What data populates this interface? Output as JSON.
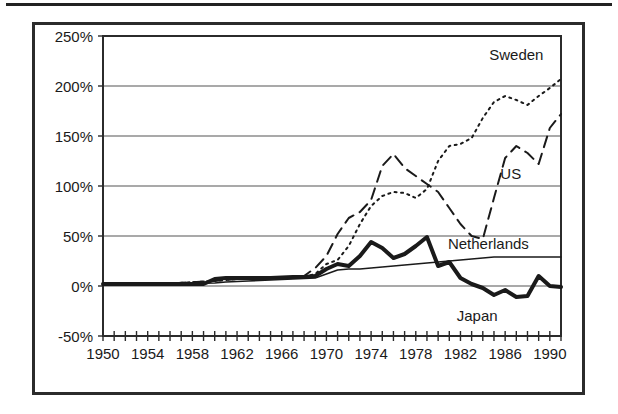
{
  "figure": {
    "frame_color": "#2b2b2b",
    "background": "#ffffff",
    "has_top_rule": true
  },
  "chart_data": {
    "type": "line",
    "title": "",
    "subtitle": "",
    "xlabel": "",
    "ylabel": "",
    "xlim": [
      1950,
      1991
    ],
    "ylim": [
      -50,
      250
    ],
    "ytick_values": [
      250,
      200,
      150,
      100,
      50,
      0,
      -50
    ],
    "ytick_labels": [
      "250%",
      "200%",
      "150%",
      "100%",
      "50%",
      "0%",
      "-50%"
    ],
    "xtick_labels": [
      "1950",
      "1954",
      "1958",
      "1962",
      "1966",
      "1970",
      "1974",
      "1978",
      "1982",
      "1986",
      "1990"
    ],
    "xtick_values": [
      1950,
      1954,
      1958,
      1962,
      1966,
      1970,
      1974,
      1978,
      1982,
      1986,
      1990
    ],
    "xtick_minor_step": 1,
    "grid": "horizontal",
    "legend_position": "inline-annotations",
    "series": [
      {
        "name": "Sweden",
        "style": "dotted",
        "color": "#1a1a1a",
        "width": 2,
        "label_x": 1987.0,
        "label_y": 232,
        "x": [
          1950,
          1955,
          1960,
          1962,
          1964,
          1966,
          1968,
          1969,
          1970,
          1971,
          1972,
          1973,
          1974,
          1975,
          1976,
          1977,
          1978,
          1979,
          1980,
          1981,
          1982,
          1983,
          1984,
          1985,
          1986,
          1987,
          1988,
          1989,
          1990,
          1991
        ],
        "y": [
          2,
          2,
          5,
          7,
          8,
          8,
          9,
          12,
          22,
          26,
          40,
          62,
          80,
          90,
          94,
          93,
          88,
          97,
          125,
          140,
          142,
          148,
          168,
          184,
          190,
          186,
          181,
          190,
          198,
          207
        ]
      },
      {
        "name": "US",
        "style": "dashed",
        "color": "#1a1a1a",
        "width": 2,
        "label_x": 1986.5,
        "label_y": 113,
        "x": [
          1950,
          1955,
          1960,
          1962,
          1964,
          1966,
          1968,
          1969,
          1970,
          1971,
          1972,
          1973,
          1974,
          1975,
          1976,
          1977,
          1978,
          1979,
          1980,
          1981,
          1982,
          1983,
          1984,
          1985,
          1986,
          1987,
          1988,
          1989,
          1990,
          1991
        ],
        "y": [
          2,
          2,
          5,
          7,
          8,
          8,
          10,
          18,
          30,
          52,
          68,
          74,
          86,
          120,
          132,
          118,
          110,
          102,
          94,
          78,
          62,
          50,
          47,
          88,
          128,
          140,
          133,
          122,
          158,
          172
        ]
      },
      {
        "name": "Netherlands",
        "style": "solid-thin",
        "color": "#1a1a1a",
        "width": 1.6,
        "label_x": 1984.5,
        "label_y": 43,
        "x": [
          1950,
          1955,
          1960,
          1961,
          1963,
          1965,
          1967,
          1969,
          1970,
          1971,
          1972,
          1973,
          1974,
          1975,
          1976,
          1977,
          1978,
          1979,
          1980,
          1981,
          1982,
          1983,
          1984,
          1985,
          1986,
          1987,
          1988,
          1989,
          1990,
          1991
        ],
        "y": [
          2,
          2,
          3,
          4,
          5,
          6,
          7,
          8,
          12,
          16,
          17,
          17,
          18,
          19,
          20,
          21,
          22,
          23,
          24,
          25,
          26,
          27,
          28,
          29,
          29,
          29,
          29,
          29,
          29,
          29
        ]
      },
      {
        "name": "Japan",
        "style": "solid-thick",
        "color": "#1a1a1a",
        "width": 4,
        "label_x": 1983.5,
        "label_y": -29,
        "x": [
          1950,
          1955,
          1959,
          1960,
          1961,
          1963,
          1965,
          1967,
          1968,
          1969,
          1970,
          1971,
          1972,
          1973,
          1974,
          1975,
          1976,
          1977,
          1978,
          1979,
          1980,
          1981,
          1982,
          1983,
          1984,
          1985,
          1986,
          1987,
          1988,
          1989,
          1990,
          1991
        ],
        "y": [
          2,
          2,
          2,
          7,
          8,
          8,
          8,
          9,
          9,
          10,
          17,
          22,
          20,
          30,
          44,
          38,
          28,
          32,
          40,
          49,
          20,
          24,
          8,
          2,
          -2,
          -9,
          -4,
          -11,
          -10,
          10,
          0,
          -1
        ]
      }
    ]
  }
}
